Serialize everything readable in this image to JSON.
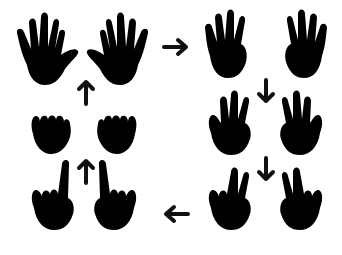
{
  "illustration": {
    "title": "Hand counting gesture cycle",
    "background": "#ffffff",
    "stroke_color": "#111111",
    "steps": [
      {
        "id": "open-hands",
        "fingers": 5,
        "position": "top-left"
      },
      {
        "id": "four-fingers",
        "fingers": 4,
        "position": "top-right"
      },
      {
        "id": "three-fingers",
        "fingers": 3,
        "position": "middle-right"
      },
      {
        "id": "two-fingers",
        "fingers": 2,
        "position": "bottom-right"
      },
      {
        "id": "one-finger",
        "fingers": 1,
        "position": "bottom-left"
      },
      {
        "id": "fists",
        "fingers": 0,
        "position": "middle-left"
      }
    ],
    "arrows": [
      {
        "direction": "right",
        "from": "open-hands",
        "to": "four-fingers"
      },
      {
        "direction": "down",
        "from": "four-fingers",
        "to": "three-fingers"
      },
      {
        "direction": "down",
        "from": "three-fingers",
        "to": "two-fingers"
      },
      {
        "direction": "left",
        "from": "two-fingers",
        "to": "one-finger"
      },
      {
        "direction": "up",
        "from": "one-finger",
        "to": "fists"
      },
      {
        "direction": "up",
        "from": "fists",
        "to": "open-hands"
      }
    ]
  }
}
